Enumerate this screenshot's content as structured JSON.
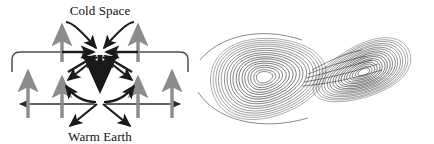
{
  "figure": {
    "background_color": "#ffffff",
    "width": 434,
    "height": 144
  },
  "panels": [
    {
      "name": "convection-diagram",
      "labels": {
        "top": "Cold Space",
        "bottom": "Warm Earth"
      },
      "colors": {
        "dark_arrow": "#1a1a1a",
        "gray_arrow": "#8c8c8c",
        "thin_line": "#4d4d4d"
      },
      "elements": {
        "top_convergence_label": "cold-convergence-node",
        "bottom_convergence_label": "warm-convergence-node",
        "central_downdraft_label": "central-downdraft-arrow",
        "rising_limb_count": 4,
        "outer_loop_count": 2
      }
    },
    {
      "name": "lorenz-attractor",
      "description": "Lorenz butterfly attractor, two lobes",
      "colors": {
        "trajectory": "#1a1a1a"
      },
      "lobes": [
        {
          "name": "left-lobe",
          "center_x": 258,
          "center_y": 79,
          "rings": 17
        },
        {
          "name": "right-lobe",
          "center_x": 370,
          "center_y": 68,
          "rings": 17
        }
      ]
    }
  ],
  "chart_data": {
    "type": "line",
    "xlabel": "",
    "ylabel": "",
    "legend": [],
    "grid": false,
    "series": [
      {
        "name": "lorenz-trajectory",
        "lobe": "left",
        "description": "Spiral orbit set around left fixed point",
        "ring_scales": [
          1.0,
          0.95,
          0.9,
          0.85,
          0.8,
          0.74,
          0.69,
          0.63,
          0.58,
          0.52,
          0.47,
          0.41,
          0.36,
          0.3,
          0.25,
          0.19,
          0.14
        ]
      },
      {
        "name": "lorenz-trajectory",
        "lobe": "right",
        "description": "Spiral orbit set around right fixed point",
        "ring_scales": [
          1.0,
          0.94,
          0.89,
          0.83,
          0.78,
          0.72,
          0.67,
          0.61,
          0.56,
          0.5,
          0.45,
          0.39,
          0.34,
          0.28,
          0.23,
          0.17,
          0.12
        ]
      }
    ]
  }
}
